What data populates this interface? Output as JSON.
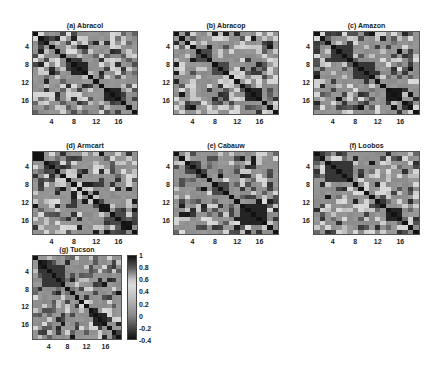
{
  "figure": {
    "panel_size": {
      "w": 106,
      "h": 84
    },
    "grid_n": 19,
    "tick_values": [
      4,
      8,
      12,
      16
    ]
  },
  "colormap": {
    "stops": [
      {
        "v": -0.4,
        "color": "#111111"
      },
      {
        "v": -0.2,
        "color": "#4a4a4a"
      },
      {
        "v": 0.0,
        "color": "#8a8a8a"
      },
      {
        "v": 0.1,
        "color": "#9a9a9a"
      },
      {
        "v": 0.3,
        "color": "#bdbdbd"
      },
      {
        "v": 0.5,
        "color": "#dcdcdc"
      },
      {
        "v": 0.6,
        "color": "#c8c8c8"
      },
      {
        "v": 0.8,
        "color": "#5a5a5a"
      },
      {
        "v": 1.0,
        "color": "#121212"
      }
    ]
  },
  "colorbar": {
    "labels": [
      "1",
      "0.8",
      "0.6",
      "0.4",
      "0.2",
      "0",
      "-0.2",
      "-0.4"
    ],
    "values": [
      1,
      0.8,
      0.6,
      0.4,
      0.2,
      0,
      -0.2,
      -0.4
    ],
    "min": -0.4,
    "max": 1.0
  },
  "chart_data": {
    "type": "heatmap",
    "title": "",
    "xlabel": "",
    "ylabel": "",
    "x_ticks": [
      4,
      8,
      12,
      16
    ],
    "y_ticks": [
      4,
      8,
      12,
      16
    ],
    "matrix_size": 19,
    "value_range": [
      -0.4,
      1.0
    ],
    "colorbar_ticks": [
      1,
      0.8,
      0.6,
      0.4,
      0.2,
      0,
      -0.2,
      -0.4
    ],
    "panels": [
      {
        "id": "a",
        "title": "(a) Abracol",
        "seed": 11,
        "blocks": [
          [
            7,
            9,
            0.95
          ],
          [
            13,
            15,
            0.95
          ]
        ]
      },
      {
        "id": "b",
        "title": "(b) Abracop",
        "seed": 23,
        "blocks": [
          [
            4,
            6,
            0.85
          ],
          [
            7,
            9,
            0.85
          ],
          [
            13,
            15,
            0.95
          ]
        ]
      },
      {
        "id": "c",
        "title": "(c) Amazon",
        "seed": 37,
        "blocks": [
          [
            3,
            6,
            0.9
          ],
          [
            7,
            10,
            0.9
          ],
          [
            13,
            15,
            0.98
          ]
        ]
      },
      {
        "id": "d",
        "title": "(d) Armcart",
        "seed": 41,
        "blocks": [
          [
            11,
            12,
            0.85
          ],
          [
            14,
            16,
            0.85
          ]
        ]
      },
      {
        "id": "e",
        "title": "(e) Cabauw",
        "seed": 53,
        "blocks": [
          [
            7,
            9,
            0.85
          ],
          [
            12,
            16,
            0.95
          ]
        ]
      },
      {
        "id": "f",
        "title": "(f) Loobos",
        "seed": 67,
        "blocks": [
          [
            2,
            6,
            0.9
          ],
          [
            13,
            15,
            0.95
          ]
        ]
      },
      {
        "id": "g",
        "title": "(g) Tucson",
        "seed": 79,
        "blocks": [
          [
            2,
            6,
            0.9
          ],
          [
            13,
            15,
            0.95
          ]
        ]
      }
    ]
  },
  "layout": {
    "panels": [
      {
        "id": "a",
        "x": 32,
        "y": 31,
        "w": 106,
        "h": 84
      },
      {
        "id": "b",
        "x": 173,
        "y": 31,
        "w": 106,
        "h": 84
      },
      {
        "id": "c",
        "x": 313,
        "y": 31,
        "w": 107,
        "h": 84
      },
      {
        "id": "d",
        "x": 32,
        "y": 151,
        "w": 106,
        "h": 84
      },
      {
        "id": "e",
        "x": 173,
        "y": 151,
        "w": 106,
        "h": 84
      },
      {
        "id": "f",
        "x": 313,
        "y": 151,
        "w": 107,
        "h": 84
      },
      {
        "id": "g",
        "x": 32,
        "y": 255,
        "w": 90,
        "h": 85
      }
    ],
    "colorbar": {
      "x": 127,
      "y": 255,
      "w": 10,
      "h": 85
    }
  }
}
